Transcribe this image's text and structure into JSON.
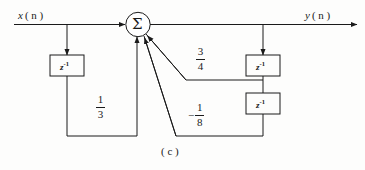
{
  "figure": {
    "caption": "( c )",
    "type": "signal-flow-block-diagram"
  },
  "signals": {
    "input_label": "x",
    "input_arg": "( n )",
    "output_label": "y",
    "output_arg": "( n )"
  },
  "blocks": {
    "delay_symbol": "z",
    "delay_exponent": "-1",
    "summer_symbol": "Σ",
    "input_delay": {
      "name": "z-inverse-input-delay"
    },
    "feedback_delay_1": {
      "name": "z-inverse-feedback-delay-1"
    },
    "feedback_delay_2": {
      "name": "z-inverse-feedback-delay-2"
    }
  },
  "coefficients": {
    "feedforward": {
      "sign": "",
      "numerator": "1",
      "denominator": "3",
      "value": 0.3333
    },
    "feedback_1": {
      "sign": "",
      "numerator": "3",
      "denominator": "4",
      "value": 0.75
    },
    "feedback_2": {
      "sign": "−",
      "numerator": "1",
      "denominator": "8",
      "value": -0.125
    }
  },
  "colors": {
    "line": "#1a1a1a",
    "background": "#fdfdfc",
    "text": "#1a1a1a"
  }
}
